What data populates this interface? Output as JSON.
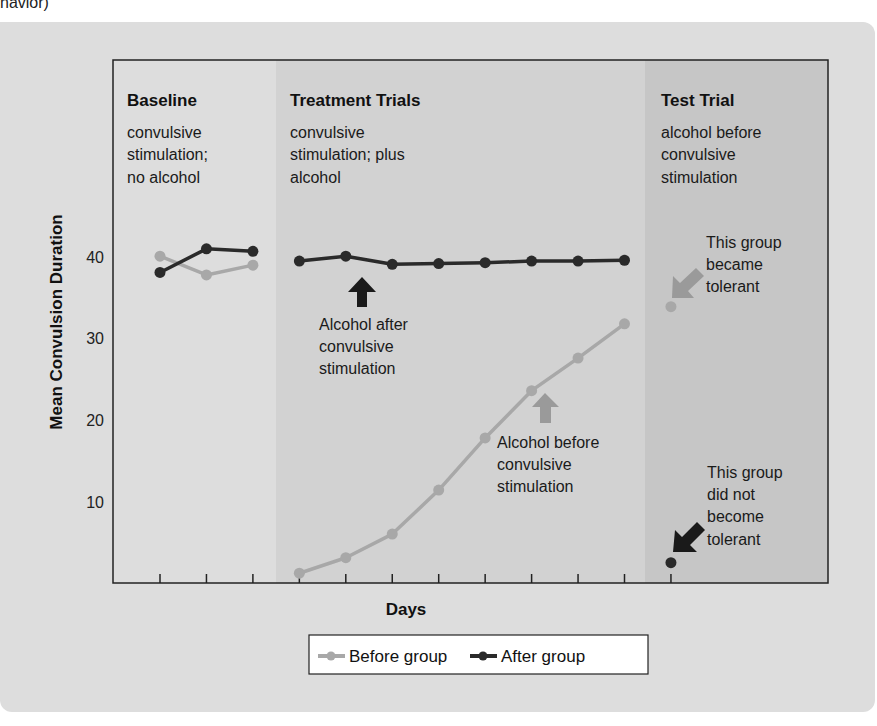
{
  "caption_fragment": "havior)",
  "chart_data": {
    "type": "line",
    "title": "",
    "xlabel": "Days",
    "ylabel": "Mean Convulsion Duration",
    "ylim": [
      0,
      48
    ],
    "yticks": [
      10,
      20,
      30,
      40
    ],
    "grid": false,
    "legend_position": "bottom-center",
    "x": [
      1,
      2,
      3,
      4,
      5,
      6,
      7,
      8,
      9,
      10,
      11,
      12
    ],
    "phases": [
      {
        "name": "Baseline",
        "description": "convulsive stimulation; no alcohol",
        "days": [
          1,
          3
        ]
      },
      {
        "name": "Treatment Trials",
        "description": "convulsive stimulation; plus alcohol",
        "days": [
          4,
          11
        ]
      },
      {
        "name": "Test Trial",
        "description": "alcohol before convulsive stimulation",
        "days": [
          12,
          12
        ]
      }
    ],
    "series": [
      {
        "name": "Before group",
        "color": "#a8a8a8",
        "values": [
          40.1,
          37.8,
          39.0,
          1.2,
          3.1,
          6.0,
          11.4,
          17.8,
          23.6,
          27.6,
          31.8,
          33.9
        ]
      },
      {
        "name": "After group",
        "color": "#2a2a2a",
        "values": [
          38.1,
          41.0,
          40.7,
          39.5,
          40.1,
          39.1,
          39.2,
          39.3,
          39.5,
          39.5,
          39.6,
          2.5
        ]
      }
    ],
    "annotations": [
      {
        "text": "Alcohol after convulsive stimulation",
        "arrow": "up",
        "color": "#1a1a1a"
      },
      {
        "text": "Alcohol before convulsive stimulation",
        "arrow": "up",
        "color": "#9a9a9a"
      },
      {
        "text": "This group became tolerant",
        "arrow": "down-left",
        "color": "#9a9a9a"
      },
      {
        "text": "This group did not become tolerant",
        "arrow": "down-left",
        "color": "#1a1a1a"
      }
    ]
  },
  "phases": {
    "baseline": {
      "title": "Baseline",
      "lines": [
        "convulsive",
        "stimulation;",
        "no alcohol"
      ]
    },
    "treatment": {
      "title": "Treatment Trials",
      "lines": [
        "convulsive",
        "stimulation; plus",
        "alcohol"
      ]
    },
    "test": {
      "title": "Test Trial",
      "lines": [
        "alcohol before",
        "convulsive",
        "stimulation"
      ]
    }
  },
  "axes": {
    "ylabel": "Mean Convulsion Duration",
    "xlabel": "Days",
    "yticks": [
      "40",
      "30",
      "20",
      "10"
    ]
  },
  "annotations": {
    "after_label": [
      "Alcohol after",
      "convulsive",
      "stimulation"
    ],
    "before_label": [
      "Alcohol before",
      "convulsive",
      "stimulation"
    ],
    "tolerant_label": [
      "This group",
      "became",
      "tolerant"
    ],
    "not_tolerant_label": [
      "This group",
      "did not",
      "become",
      "tolerant"
    ]
  },
  "legend": {
    "before": "Before group",
    "after": "After group"
  },
  "colors": {
    "panel_bg": "#dddddd",
    "baseline_bg": "#dddddd",
    "treatment_bg": "#d2d2d2",
    "test_bg": "#c6c6c6",
    "before": "#a8a8a8",
    "after": "#2a2a2a"
  }
}
